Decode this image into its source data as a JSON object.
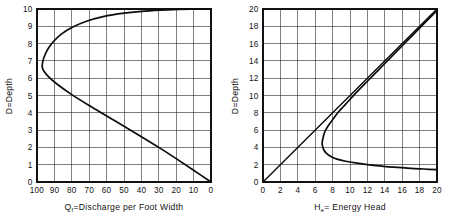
{
  "figure": {
    "name": "open-channel-flow-curves",
    "panels": [
      "discharge-depth-curve",
      "specific-energy-curve"
    ]
  },
  "chart_data": [
    {
      "id": "discharge-depth",
      "type": "line",
      "title": "",
      "xlabel": "Qf = Discharge per Foot Width",
      "xlabel_main": "=Discharge  per  Foot  Width",
      "xlabel_symbol": "Q",
      "xlabel_sub": "f",
      "ylabel": "D=Depth",
      "xlim": [
        100,
        0
      ],
      "ylim": [
        0,
        10
      ],
      "x_reversed": true,
      "xticks": [
        100,
        90,
        80,
        70,
        60,
        50,
        40,
        30,
        20,
        10,
        0
      ],
      "yticks": [
        0,
        1,
        2,
        3,
        4,
        5,
        6,
        7,
        8,
        9,
        10
      ],
      "grid": true,
      "legend": "none",
      "series": [
        {
          "name": "Discharge curve (constant specific energy)",
          "comment": "Q plotted against depth D; single curve with a maximum discharge (critical depth) near Q=97 at D=6.6",
          "points": [
            [
              0,
              0
            ],
            [
              10,
              0.68
            ],
            [
              20,
              1.35
            ],
            [
              30,
              2.0
            ],
            [
              40,
              2.62
            ],
            [
              50,
              3.22
            ],
            [
              60,
              3.82
            ],
            [
              70,
              4.42
            ],
            [
              80,
              5.05
            ],
            [
              88,
              5.62
            ],
            [
              93,
              6.05
            ],
            [
              96,
              6.4
            ],
            [
              97,
              6.65
            ],
            [
              96.6,
              7.0
            ],
            [
              95.2,
              7.4
            ],
            [
              93,
              7.8
            ],
            [
              90,
              8.18
            ],
            [
              86,
              8.55
            ],
            [
              80,
              8.93
            ],
            [
              72,
              9.28
            ],
            [
              62,
              9.56
            ],
            [
              50,
              9.76
            ],
            [
              38,
              9.88
            ],
            [
              25,
              9.95
            ],
            [
              12,
              9.99
            ],
            [
              0,
              10
            ]
          ]
        }
      ]
    },
    {
      "id": "specific-energy",
      "type": "line",
      "title": "",
      "xlabel": "He = Energy Head",
      "xlabel_main": "= Energy  Head",
      "xlabel_symbol": "H",
      "xlabel_sub": "e",
      "ylabel": "D=Depth",
      "xlim": [
        0,
        20
      ],
      "ylim": [
        0,
        20
      ],
      "x_reversed": false,
      "xticks": [
        0,
        2,
        4,
        6,
        8,
        10,
        12,
        14,
        16,
        18,
        20
      ],
      "yticks": [
        0,
        2,
        4,
        6,
        8,
        10,
        12,
        14,
        16,
        18,
        20
      ],
      "grid": true,
      "legend": "none",
      "series": [
        {
          "name": "Specific energy curve",
          "comment": "E-D curve with minimum energy near He=6.8 at D=4.5; upper limb asymptotic to D=He line, lower limb asymptotic to D-axis",
          "points": [
            [
              20,
              19.8
            ],
            [
              18,
              17.8
            ],
            [
              16,
              15.75
            ],
            [
              14,
              13.7
            ],
            [
              12,
              11.65
            ],
            [
              10.5,
              10.1
            ],
            [
              9.5,
              9.0
            ],
            [
              8.6,
              8.0
            ],
            [
              8.0,
              7.2
            ],
            [
              7.5,
              6.5
            ],
            [
              7.15,
              5.9
            ],
            [
              6.95,
              5.3
            ],
            [
              6.85,
              4.85
            ],
            [
              6.8,
              4.5
            ],
            [
              6.85,
              4.1
            ],
            [
              7.0,
              3.7
            ],
            [
              7.3,
              3.3
            ],
            [
              7.8,
              2.95
            ],
            [
              8.5,
              2.65
            ],
            [
              9.5,
              2.4
            ],
            [
              11.0,
              2.15
            ],
            [
              13.0,
              1.9
            ],
            [
              15.0,
              1.72
            ],
            [
              17.0,
              1.58
            ],
            [
              18.5,
              1.5
            ],
            [
              20,
              1.42
            ]
          ]
        },
        {
          "name": "D = He reference line",
          "comment": "45 degree line through the origin",
          "points": [
            [
              0,
              0
            ],
            [
              20,
              20
            ]
          ]
        }
      ]
    }
  ]
}
